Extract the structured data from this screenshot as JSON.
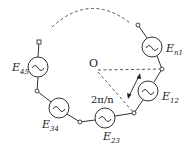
{
  "diagram": {
    "center_label": "O",
    "angle_label": "2π/n",
    "sources": [
      {
        "name": "E",
        "sub": "n1"
      },
      {
        "name": "E",
        "sub": "12"
      },
      {
        "name": "E",
        "sub": "23"
      },
      {
        "name": "E",
        "sub": "34"
      },
      {
        "name": "E",
        "sub": "45"
      }
    ],
    "source_symbol": "~",
    "colors": {
      "stroke": "#333333",
      "background": "#ffffff"
    }
  }
}
